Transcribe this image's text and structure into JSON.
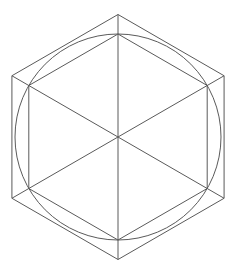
{
  "diagram": {
    "title": "",
    "stroke_color": "#5a5a5a",
    "background_color": "#ffffff",
    "shapes": [
      {
        "name": "outer-hexagon",
        "type": "hexagon",
        "orientation": "pointy-top"
      },
      {
        "name": "inscribed-circle",
        "type": "circle"
      },
      {
        "name": "inner-hexagon",
        "type": "hexagon",
        "orientation": "pointy-top"
      },
      {
        "name": "diagonals",
        "type": "lines",
        "count": 3
      }
    ]
  }
}
